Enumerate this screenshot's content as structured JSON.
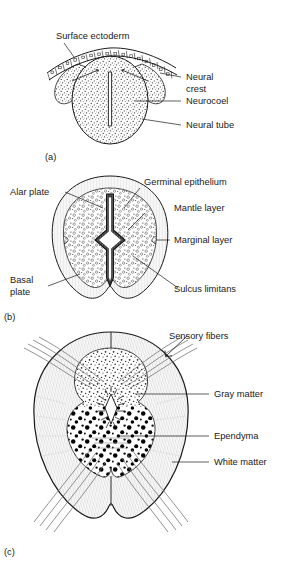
{
  "figure": {
    "background_color": "#ffffff",
    "line_color": "#1a1a1a"
  },
  "panels": [
    {
      "id": "a",
      "caption": "(a)",
      "labels": [
        {
          "name": "surface-ectoderm",
          "text": "Surface ectoderm"
        },
        {
          "name": "neural-crest-line1",
          "text": "Neural"
        },
        {
          "name": "neural-crest-line2",
          "text": "crest"
        },
        {
          "name": "neurocoel",
          "text": "Neurocoel"
        },
        {
          "name": "neural-tube",
          "text": "Neural tube"
        }
      ]
    },
    {
      "id": "b",
      "caption": "(b)",
      "labels": [
        {
          "name": "alar-plate",
          "text": "Alar plate"
        },
        {
          "name": "basal-plate-line1",
          "text": "Basal"
        },
        {
          "name": "basal-plate-line2",
          "text": "plate"
        },
        {
          "name": "germinal-epithelium",
          "text": "Germinal epithelium"
        },
        {
          "name": "mantle-layer",
          "text": "Mantle layer"
        },
        {
          "name": "marginal-layer",
          "text": "Marginal layer"
        },
        {
          "name": "sulcus-limitans",
          "text": "Sulcus limitans"
        }
      ]
    },
    {
      "id": "c",
      "caption": "(c)",
      "labels": [
        {
          "name": "sensory-fibers",
          "text": "Sensory fibers"
        },
        {
          "name": "gray-matter",
          "text": "Gray matter"
        },
        {
          "name": "ependyma",
          "text": "Ependyma"
        },
        {
          "name": "white-matter",
          "text": "White matter"
        }
      ]
    }
  ]
}
